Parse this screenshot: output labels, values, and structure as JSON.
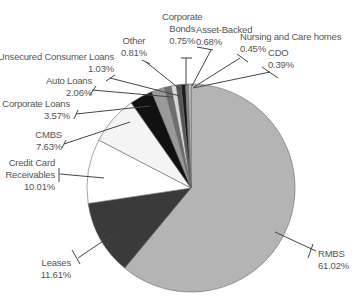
{
  "chart_data": {
    "type": "pie",
    "title": "",
    "start_angle_deg": 0,
    "direction": "clockwise",
    "slices": [
      {
        "label": "RMBS",
        "value": 61.02,
        "display": "61.02%",
        "color": "#b4b4b4"
      },
      {
        "label": "Leases",
        "value": 11.61,
        "display": "11.61%",
        "color": "#3a3a3a"
      },
      {
        "label": "Credit Card Receivables",
        "value": 10.01,
        "display": "10.01%",
        "color": "#ffffff"
      },
      {
        "label": "CMBS",
        "value": 7.63,
        "display": "7.63%",
        "color": "#f4f4f4"
      },
      {
        "label": "Corporate Loans",
        "value": 3.57,
        "display": "3.57%",
        "color": "#111111"
      },
      {
        "label": "Auto Loans",
        "value": 2.06,
        "display": "2.06%",
        "color": "#9a9a9a"
      },
      {
        "label": "Unsecured Consumer Loans",
        "value": 1.03,
        "display": "1.03%",
        "color": "#6e6e6e"
      },
      {
        "label": "Other",
        "value": 0.81,
        "display": "0.81%",
        "color": "#d8d8d8"
      },
      {
        "label": "Corporate Bonds",
        "value": 0.75,
        "display": "0.75%",
        "color": "#555555"
      },
      {
        "label": "Asset-Backed",
        "value": 0.68,
        "display": "0.68%",
        "color": "#1a1a1a"
      },
      {
        "label": "Nursing and Care homes",
        "value": 0.45,
        "display": "0.45%",
        "color": "#888888"
      },
      {
        "label": "CDO",
        "value": 0.39,
        "display": "0.39%",
        "color": "#c8c8c8"
      }
    ],
    "legend": "none (callout labels)"
  },
  "labels": {
    "corporate_bonds": {
      "line1": "Corporate",
      "line2": "Bonds",
      "pct": "0.75%"
    },
    "asset_backed": {
      "line1": "Asset-Backed",
      "pct": "0.68%"
    },
    "nursing": {
      "line1": "Nursing and Care homes",
      "pct": "0.45%"
    },
    "cdo": {
      "line1": "CDO",
      "pct": "0.39%"
    },
    "other": {
      "line1": "Other",
      "pct": "0.81%"
    },
    "unsecured": {
      "line1": "Unsecured Consumer Loans",
      "pct": "1.03%"
    },
    "auto": {
      "line1": "Auto Loans",
      "pct": "2.06%"
    },
    "corporate_loans": {
      "line1": "Corporate Loans",
      "pct": "3.57%"
    },
    "cmbs": {
      "line1": "CMBS",
      "pct": "7.63%"
    },
    "ccr": {
      "line1": "Credit Card",
      "line2": "Receivables",
      "pct": "10.01%"
    },
    "leases": {
      "line1": "Leases",
      "pct": "11.61%"
    },
    "rmbs": {
      "line1": "RMBS",
      "pct": "61.02%"
    }
  }
}
